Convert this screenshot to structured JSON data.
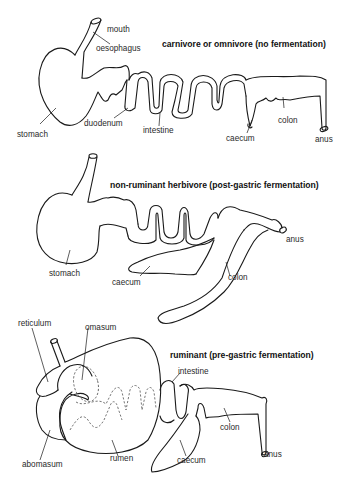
{
  "diagrams": [
    {
      "id": "carnivore",
      "title": "carnivore or omnivore (no fermentation)",
      "labels": {
        "mouth": "mouth",
        "oesophagus": "oesophagus",
        "stomach": "stomach",
        "duodenum": "duodenum",
        "intestine": "intestine",
        "caecum": "caecum",
        "colon": "colon",
        "anus": "anus"
      }
    },
    {
      "id": "non-ruminant-herbivore",
      "title": "non-ruminant herbivore (post-gastric fermentation)",
      "labels": {
        "stomach": "stomach",
        "caecum": "caecum",
        "colon": "colon",
        "anus": "anus"
      }
    },
    {
      "id": "ruminant",
      "title": "ruminant (pre-gastric fermentation)",
      "labels": {
        "reticulum": "reticulum",
        "omasum": "omasum",
        "intestine": "intestine",
        "abomasum": "abomasum",
        "rumen": "rumen",
        "caecum": "caecum",
        "colon": "colon",
        "anus": "anus"
      }
    }
  ],
  "colors": {
    "line": "#1a1a1a",
    "text": "#2a2a2a",
    "background": "#ffffff"
  }
}
